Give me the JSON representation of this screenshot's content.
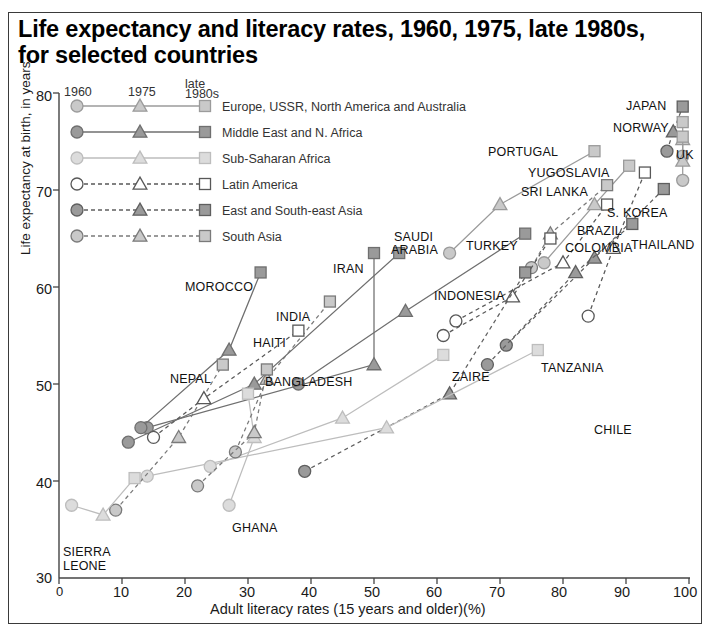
{
  "title": "Life expectancy and literacy rates, 1960, 1975, late 1980s, for selected countries",
  "axes": {
    "xlabel": "Adult literacy rates (15 years and older)(%)",
    "ylabel": "Life expectancy at birth, in years",
    "xticks": [
      "0",
      "10",
      "20",
      "30",
      "40",
      "50",
      "60",
      "70",
      "80",
      "90",
      "100"
    ],
    "yticks": [
      "30",
      "40",
      "50",
      "60",
      "70",
      "80"
    ],
    "xlim": [
      0,
      100
    ],
    "ylim": [
      30,
      80
    ]
  },
  "legend": {
    "headers": [
      "1960",
      "1975",
      "late\n1980s"
    ],
    "header_1960": "1960",
    "header_1975": "1975",
    "header_late_line1": "late",
    "header_late_line2": "1980s",
    "entries": [
      {
        "label": "Europe, USSR, North America and Australia",
        "fill": "#c9c9c9",
        "stroke": "#9b9b9b",
        "dash": "none"
      },
      {
        "label": "Middle East and N. Africa",
        "fill": "#9a9a9a",
        "stroke": "#6f6f6f",
        "dash": "none"
      },
      {
        "label": "Sub-Saharan Africa",
        "fill": "#dcdcdc",
        "stroke": "#bdbdbd",
        "dash": "none"
      },
      {
        "label": "Latin America",
        "fill": "#ffffff",
        "stroke": "#585858",
        "dash": "dashed"
      },
      {
        "label": "East and South-east Asia",
        "fill": "#9a9a9a",
        "stroke": "#5f5f5f",
        "dash": "dashed"
      },
      {
        "label": "South Asia",
        "fill": "#c9c9c9",
        "stroke": "#7a7a7a",
        "dash": "dashed"
      }
    ]
  },
  "chart_data": {
    "type": "scatter",
    "title": "Life expectancy and literacy rates, 1960, 1975, late 1980s, for selected countries",
    "xlabel": "Adult literacy rates (15 years and older)(%)",
    "ylabel": "Life expectancy at birth, in years",
    "xlim": [
      0,
      100
    ],
    "ylim": [
      30,
      80
    ],
    "grid": false,
    "legend_position": "top-left inside plot",
    "marker_meaning": {
      "circle": "1960",
      "triangle": "1975",
      "square": "late 1980s"
    },
    "groups": [
      {
        "name": "Europe, USSR, North America and Australia",
        "fill": "#c9c9c9",
        "stroke": "#9b9b9b",
        "dash": "none"
      },
      {
        "name": "Middle East and N. Africa",
        "fill": "#9a9a9a",
        "stroke": "#6f6f6f",
        "dash": "none"
      },
      {
        "name": "Sub-Saharan Africa",
        "fill": "#dcdcdc",
        "stroke": "#bdbdbd",
        "dash": "none"
      },
      {
        "name": "Latin America",
        "fill": "#ffffff",
        "stroke": "#585858",
        "dash": "dashed"
      },
      {
        "name": "East and South-east Asia",
        "fill": "#9a9a9a",
        "stroke": "#5f5f5f",
        "dash": "dashed"
      },
      {
        "name": "South Asia",
        "fill": "#c9c9c9",
        "stroke": "#7a7a7a",
        "dash": "dashed"
      }
    ],
    "series": [
      {
        "country": "JAPAN",
        "group": "East and South-east Asia",
        "points": {
          "1960": [
            96.5,
            74.0
          ],
          "1975": [
            97.5,
            76.0
          ],
          "1980s": [
            99.0,
            78.6
          ]
        }
      },
      {
        "country": "NORWAY",
        "group": "Europe, USSR, North America and Australia",
        "points": {
          "1960": [
            99.0,
            73.5
          ],
          "1975": [
            99.0,
            75.2
          ],
          "1980s": [
            99.0,
            77.0
          ]
        }
      },
      {
        "country": "UK",
        "group": "Europe, USSR, North America and Australia",
        "points": {
          "1960": [
            99.0,
            71.0
          ],
          "1975": [
            99.0,
            73.0
          ],
          "1980s": [
            99.0,
            75.5
          ]
        }
      },
      {
        "country": "S. KOREA",
        "group": "East and South-east Asia",
        "points": {
          "1960": [
            71.0,
            54.0
          ],
          "1975": [
            85.0,
            63.0
          ],
          "1980s": [
            96.0,
            70.1
          ]
        }
      },
      {
        "country": "PORTUGAL",
        "group": "Europe, USSR, North America and Australia",
        "points": {
          "1960": [
            62.0,
            63.5
          ],
          "1975": [
            70.0,
            68.5
          ],
          "1980s": [
            85.0,
            74.0
          ]
        }
      },
      {
        "country": "YUGOSLAVIA",
        "group": "Europe, USSR, North America and Australia",
        "points": {
          "1960": [
            77.0,
            62.5
          ],
          "1975": [
            85.0,
            68.5
          ],
          "1980s": [
            90.5,
            72.5
          ]
        }
      },
      {
        "country": "SRI LANKA",
        "group": "South Asia",
        "points": {
          "1960": [
            75.0,
            62.0
          ],
          "1975": [
            78.0,
            65.5
          ],
          "1980s": [
            87.0,
            70.5
          ]
        }
      },
      {
        "country": "THAILAND",
        "group": "East and South-east Asia",
        "points": {
          "1960": [
            68.0,
            52.0
          ],
          "1975": [
            82.0,
            61.5
          ],
          "1980s": [
            91.0,
            66.5
          ]
        }
      },
      {
        "country": "BRAZIL",
        "group": "Latin America",
        "points": {
          "1960": [
            61.0,
            55.0
          ],
          "1975": [
            72.0,
            59.0
          ],
          "1980s": [
            78.0,
            65.0
          ]
        }
      },
      {
        "country": "COLOMBIA",
        "group": "Latin America",
        "points": {
          "1960": [
            63.0,
            56.5
          ],
          "1975": [
            80.0,
            62.5
          ],
          "1980s": [
            87.0,
            68.5
          ]
        }
      },
      {
        "country": "CHILE",
        "group": "Latin America",
        "points": {
          "1960": [
            84.0,
            57.0
          ],
          "1975": [
            88.0,
            64.0
          ],
          "1980s": [
            93.0,
            71.8
          ]
        }
      },
      {
        "country": "TURKEY",
        "group": "Middle East and N. Africa",
        "points": {
          "1960": [
            38.0,
            50.0
          ],
          "1975": [
            55.0,
            57.5
          ],
          "1980s": [
            74.0,
            65.5
          ]
        }
      },
      {
        "country": "INDONESIA",
        "group": "East and South-east Asia",
        "points": {
          "1960": [
            39.0,
            41.0
          ],
          "1975": [
            62.0,
            49.0
          ],
          "1980s": [
            74.0,
            61.5
          ]
        }
      },
      {
        "country": "SAUDI ARABIA",
        "group": "Middle East and N. Africa",
        "points": {
          "1960": [
            11.0,
            44.0
          ],
          "1975": [
            31.0,
            50.0
          ],
          "1980s": [
            54.0,
            63.5
          ]
        }
      },
      {
        "country": "IRAN",
        "group": "Middle East and N. Africa",
        "points": {
          "1960": [
            14.0,
            45.5
          ],
          "1975": [
            50.0,
            52.0
          ],
          "1980s": [
            50.0,
            63.5
          ]
        }
      },
      {
        "country": "MOROCCO",
        "group": "Middle East and N. Africa",
        "points": {
          "1960": [
            13.0,
            45.5
          ],
          "1975": [
            27.0,
            53.5
          ],
          "1980s": [
            32.0,
            61.5
          ]
        }
      },
      {
        "country": "TANZANIA",
        "group": "Sub-Saharan Africa",
        "points": {
          "1960": [
            14.0,
            40.5
          ],
          "1975": [
            52.0,
            45.5
          ],
          "1980s": [
            76.0,
            53.5
          ]
        }
      },
      {
        "country": "ZAIRE",
        "group": "Sub-Saharan Africa",
        "points": {
          "1960": [
            24.0,
            41.5
          ],
          "1975": [
            45.0,
            46.5
          ],
          "1980s": [
            61.0,
            53.0
          ]
        }
      },
      {
        "country": "GHANA",
        "group": "Sub-Saharan Africa",
        "points": {
          "1960": [
            27.0,
            37.5
          ],
          "1975": [
            31.0,
            44.5
          ],
          "1980s": [
            30.0,
            49.0
          ]
        }
      },
      {
        "country": "INDIA",
        "group": "South Asia",
        "points": {
          "1960": [
            28.0,
            43.0
          ],
          "1975": [
            33.0,
            50.5
          ],
          "1980s": [
            43.0,
            58.5
          ]
        }
      },
      {
        "country": "BANGLADESH",
        "group": "South Asia",
        "points": {
          "1960": [
            22.0,
            39.5
          ],
          "1975": [
            31.0,
            45.0
          ],
          "1980s": [
            33.0,
            51.5
          ]
        }
      },
      {
        "country": "NEPAL",
        "group": "South Asia",
        "points": {
          "1960": [
            9.0,
            37.0
          ],
          "1975": [
            19.0,
            44.5
          ],
          "1980s": [
            26.0,
            52.0
          ]
        }
      },
      {
        "country": "HAITI",
        "group": "Latin America",
        "points": {
          "1960": [
            15.0,
            44.5
          ],
          "1975": [
            23.0,
            48.5
          ],
          "1980s": [
            38.0,
            55.5
          ]
        }
      },
      {
        "country": "SIERRA LEONE",
        "group": "Sub-Saharan Africa",
        "points": {
          "1960": [
            2.0,
            37.5
          ],
          "1975": [
            7.0,
            36.5
          ],
          "1980s": [
            12.0,
            40.3
          ]
        }
      }
    ]
  },
  "country_labels": [
    {
      "text": "JAPAN",
      "x": 626,
      "y": 99
    },
    {
      "text": "NORWAY",
      "x": 613,
      "y": 121
    },
    {
      "text": "UK",
      "x": 676,
      "y": 148
    },
    {
      "text": "PORTUGAL",
      "x": 488,
      "y": 145
    },
    {
      "text": "YUGOSLAVIA",
      "x": 528,
      "y": 166
    },
    {
      "text": "SRI LANKA",
      "x": 521,
      "y": 185
    },
    {
      "text": "S. KOREA",
      "x": 607,
      "y": 206
    },
    {
      "text": "THAILAND",
      "x": 631,
      "y": 238
    },
    {
      "text": "BRAZIL",
      "x": 577,
      "y": 224
    },
    {
      "text": "COLOMBIA",
      "x": 565,
      "y": 241
    },
    {
      "text": "CHILE",
      "x": 594,
      "y": 423
    },
    {
      "text": "TURKEY",
      "x": 466,
      "y": 239
    },
    {
      "text": "INDONESIA",
      "x": 434,
      "y": 289
    },
    {
      "text": "SAUDI",
      "x": 394,
      "y": 230
    },
    {
      "text": "ARABIA",
      "x": 391,
      "y": 243
    },
    {
      "text": "IRAN",
      "x": 333,
      "y": 262
    },
    {
      "text": "MOROCCO",
      "x": 185,
      "y": 280
    },
    {
      "text": "TANZANIA",
      "x": 541,
      "y": 361
    },
    {
      "text": "ZAIRE",
      "x": 452,
      "y": 370
    },
    {
      "text": "GHANA",
      "x": 232,
      "y": 521
    },
    {
      "text": "INDIA",
      "x": 276,
      "y": 310
    },
    {
      "text": "BANGLADESH",
      "x": 265,
      "y": 375
    },
    {
      "text": "NEPAL",
      "x": 170,
      "y": 372
    },
    {
      "text": "HAITI",
      "x": 253,
      "y": 336
    },
    {
      "text": "SIERRA",
      "x": 63,
      "y": 545
    },
    {
      "text": "LEONE",
      "x": 63,
      "y": 559
    }
  ]
}
